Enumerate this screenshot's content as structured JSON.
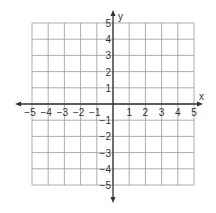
{
  "chart_data": {
    "type": "coordinate-grid",
    "title": "",
    "xlabel": "x",
    "ylabel": "y",
    "xlim": [
      -5,
      5
    ],
    "ylim": [
      -5,
      5
    ],
    "grid": true,
    "x_ticks": [
      "-5",
      "-4",
      "-3",
      "-2",
      "-1",
      "1",
      "2",
      "3",
      "4",
      "5"
    ],
    "y_ticks": [
      "5",
      "4",
      "3",
      "2",
      "1",
      "-1",
      "-2",
      "-3",
      "-4",
      "-5"
    ],
    "points": []
  },
  "colors": {
    "grid": "#999999",
    "axis": "#333333",
    "text": "#333333",
    "background": "#ffffff"
  }
}
